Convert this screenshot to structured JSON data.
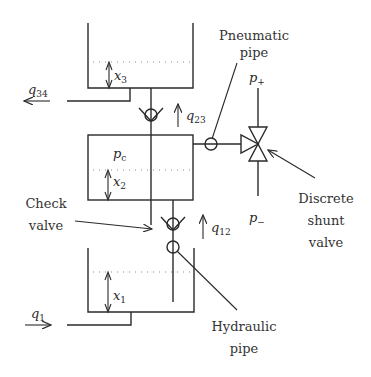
{
  "diagram": {
    "tanks": [
      {
        "id": "tank-3",
        "level_label": "x",
        "level_sub": "3"
      },
      {
        "id": "tank-2",
        "level_label": "x",
        "level_sub": "2",
        "pressure_label": "p",
        "pressure_sub": "c"
      },
      {
        "id": "tank-1",
        "level_label": "x",
        "level_sub": "1"
      }
    ],
    "flows": {
      "q34": {
        "sym": "q",
        "sub": "34"
      },
      "q23": {
        "sym": "q",
        "sub": "23"
      },
      "q12": {
        "sym": "q",
        "sub": "12"
      },
      "q1": {
        "sym": "q",
        "sub": "1"
      }
    },
    "pressures": {
      "p_plus": {
        "sym": "p",
        "sub": "+"
      },
      "p_minus": {
        "sym": "p",
        "sub": "−"
      }
    },
    "annotations": {
      "pneumatic_pipe": [
        "Pneumatic",
        "pipe"
      ],
      "check_valve": [
        "Check",
        "valve"
      ],
      "discrete_shunt_valve": [
        "Discrete",
        "shunt",
        "valve"
      ],
      "hydraulic_pipe": [
        "Hydraulic",
        "pipe"
      ]
    },
    "colors": {
      "ink": "#2a2a2a",
      "dotted": "#8a8a8a",
      "background": "#ffffff"
    }
  }
}
